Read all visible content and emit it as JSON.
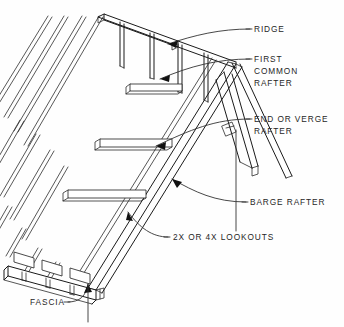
{
  "diagram": {
    "background_color": "#fefefe",
    "line_color": "#1a1a1a",
    "text_color": "#262626"
  },
  "labels": [
    {
      "id": "ridge",
      "text": "RIDGE",
      "x": 254,
      "y": 32,
      "lines": [
        "RIDGE"
      ]
    },
    {
      "id": "first-common-rafter",
      "text": "FIRST COMMON RAFTER",
      "x": 254,
      "y": 62,
      "lines": [
        "FIRST",
        "COMMON",
        "RAFTER"
      ]
    },
    {
      "id": "end-or-verge-rafter",
      "text": "END OR VERGE RAFTER",
      "x": 254,
      "y": 122,
      "lines": [
        "END OR VERGE",
        "RAFTER"
      ]
    },
    {
      "id": "barge-rafter",
      "text": "BARGE RAFTER",
      "x": 250,
      "y": 205,
      "lines": [
        "BARGE RAFTER"
      ]
    },
    {
      "id": "lookouts",
      "text": "2X OR 4X LOOKOUTS",
      "x": 173,
      "y": 240,
      "lines": [
        "2X OR 4X LOOKOUTS"
      ]
    },
    {
      "id": "fascia",
      "text": "FASCIA",
      "x": 30,
      "y": 305,
      "lines": [
        "FASCIA"
      ]
    }
  ],
  "components": [
    {
      "id": "ridge-board",
      "name": "ridge"
    },
    {
      "id": "common-rafter",
      "name": "first common rafter"
    },
    {
      "id": "verge-rafter",
      "name": "end or verge rafter"
    },
    {
      "id": "barge-rafter-member",
      "name": "barge rafter"
    },
    {
      "id": "lookout-blocks",
      "name": "2x or 4x lookouts"
    },
    {
      "id": "fascia-board",
      "name": "fascia"
    },
    {
      "id": "roof-sheathing",
      "name": "roof sheathing boards"
    }
  ]
}
